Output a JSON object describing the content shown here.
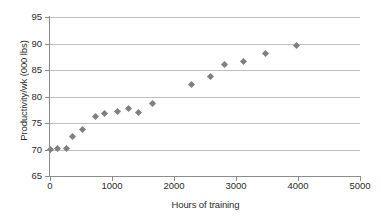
{
  "chart_data": {
    "type": "scatter",
    "title": "",
    "xlabel": "Hours of training",
    "ylabel": "Productivity/wk (000 lbs)",
    "xlim": [
      0,
      5000
    ],
    "ylim": [
      65,
      95
    ],
    "xticks": [
      0,
      1000,
      2000,
      3000,
      4000,
      5000
    ],
    "yticks": [
      65,
      70,
      75,
      80,
      85,
      90,
      95
    ],
    "xtick_labels": [
      "0",
      "1000",
      "2000",
      "3000",
      "4000",
      "5000"
    ],
    "ytick_labels": [
      "65",
      "70",
      "75",
      "80",
      "85",
      "90",
      "95"
    ],
    "grid": "horizontal",
    "legend": "none",
    "marker": "diamond",
    "marker_color": "#7f7f7f",
    "series": [
      {
        "name": "Productivity vs hours of training",
        "points": [
          {
            "x": 10,
            "y": 70.0
          },
          {
            "x": 120,
            "y": 70.1
          },
          {
            "x": 260,
            "y": 70.2
          },
          {
            "x": 370,
            "y": 72.4
          },
          {
            "x": 520,
            "y": 73.8
          },
          {
            "x": 740,
            "y": 76.3
          },
          {
            "x": 880,
            "y": 76.7
          },
          {
            "x": 1090,
            "y": 77.2
          },
          {
            "x": 1270,
            "y": 77.7
          },
          {
            "x": 1430,
            "y": 76.9
          },
          {
            "x": 1660,
            "y": 78.7
          },
          {
            "x": 2290,
            "y": 82.3
          },
          {
            "x": 2590,
            "y": 83.8
          },
          {
            "x": 2820,
            "y": 86.1
          },
          {
            "x": 3120,
            "y": 86.6
          },
          {
            "x": 3480,
            "y": 88.2
          },
          {
            "x": 3970,
            "y": 89.6
          }
        ]
      }
    ]
  },
  "colors": {
    "marker": "#7f7f7f",
    "gridline": "#bfbfbf",
    "axis": "#8c8c8c",
    "text": "#2b2b2b",
    "background": "#ffffff"
  }
}
